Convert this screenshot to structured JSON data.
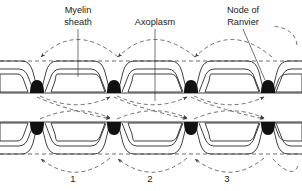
{
  "figure": {
    "labels": {
      "myelin_line1": "Myelin",
      "myelin_line2": "sheath",
      "axoplasm": "Axoplasm",
      "node_line1": "Node of",
      "node_line2": "Ranvier"
    },
    "step_numbers": [
      "1",
      "2",
      "3"
    ],
    "colors": {
      "ink": "#1a1a1a",
      "membrane": "#2b2b2b",
      "dashed": "#4a4a4a",
      "node_fill": "#111111",
      "background": "#ffffff"
    }
  }
}
